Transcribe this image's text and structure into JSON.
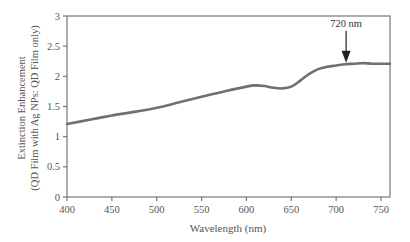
{
  "chart_data": {
    "type": "line",
    "title": "",
    "xlabel": "Wavelength (nm)",
    "ylabel": [
      "Extinction Enhancement",
      "(QD Film with Ag NPs: QD Film only)"
    ],
    "xlim": [
      400,
      760
    ],
    "ylim": [
      0,
      3
    ],
    "xticks": [
      400,
      450,
      500,
      550,
      600,
      650,
      700,
      750
    ],
    "yticks": [
      0,
      0.5,
      1,
      1.5,
      2,
      2.5,
      3
    ],
    "ytick_labels": [
      "0",
      "0.5",
      "1",
      "1.5",
      "2",
      "2.5",
      "3"
    ],
    "grid": false,
    "series": [
      {
        "name": "Extinction Enhancement",
        "color": "#707070",
        "x": [
          400,
          425,
          450,
          475,
          500,
          525,
          550,
          575,
          600,
          610,
          620,
          630,
          640,
          650,
          660,
          670,
          680,
          690,
          700,
          710,
          720,
          730,
          740,
          750,
          760
        ],
        "y": [
          1.21,
          1.28,
          1.35,
          1.41,
          1.48,
          1.57,
          1.66,
          1.75,
          1.83,
          1.85,
          1.84,
          1.81,
          1.8,
          1.83,
          1.93,
          2.04,
          2.12,
          2.16,
          2.18,
          2.2,
          2.21,
          2.22,
          2.21,
          2.21,
          2.21
        ]
      }
    ],
    "annotations": [
      {
        "text": "720 nm",
        "x": 720,
        "y": 2.21,
        "type": "arrow-down"
      }
    ]
  }
}
